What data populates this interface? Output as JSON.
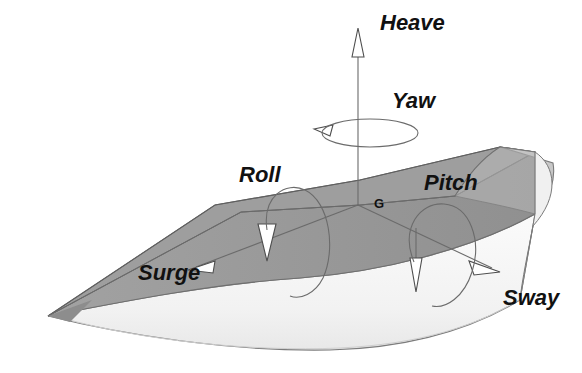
{
  "diagram": {
    "center_of_gravity_label": "G",
    "colors": {
      "background": "#ffffff",
      "deck_fill": "#9a9a9a",
      "deck_fill_dark": "#8e8e8e",
      "hull_fill": "#f4f4f4",
      "hull_shadow": "#e2e2e2",
      "transom_fill": "#cfcfcf",
      "outline": "#4d4d4d",
      "axis_line": "#6b6b6b",
      "text": "#111111"
    },
    "motions": [
      {
        "name": "heave",
        "label": "Heave",
        "kind": "translation",
        "axis": "vertical",
        "direction": "up",
        "label_x": 380,
        "label_y": 30
      },
      {
        "name": "yaw",
        "label": "Yaw",
        "kind": "rotation",
        "axis": "vertical",
        "direction": "counter-clockwise",
        "label_x": 392,
        "label_y": 108
      },
      {
        "name": "roll",
        "label": "Roll",
        "kind": "rotation",
        "axis": "longitudinal",
        "direction": "clockwise",
        "label_x": 239,
        "label_y": 182
      },
      {
        "name": "pitch",
        "label": "Pitch",
        "kind": "rotation",
        "axis": "transverse",
        "direction": "clockwise",
        "label_x": 424,
        "label_y": 190
      },
      {
        "name": "surge",
        "label": "Surge",
        "kind": "translation",
        "axis": "longitudinal",
        "direction": "forward",
        "label_x": 138,
        "label_y": 280
      },
      {
        "name": "sway",
        "label": "Sway",
        "kind": "translation",
        "axis": "transverse",
        "direction": "starboard",
        "label_x": 503,
        "label_y": 305
      }
    ]
  }
}
